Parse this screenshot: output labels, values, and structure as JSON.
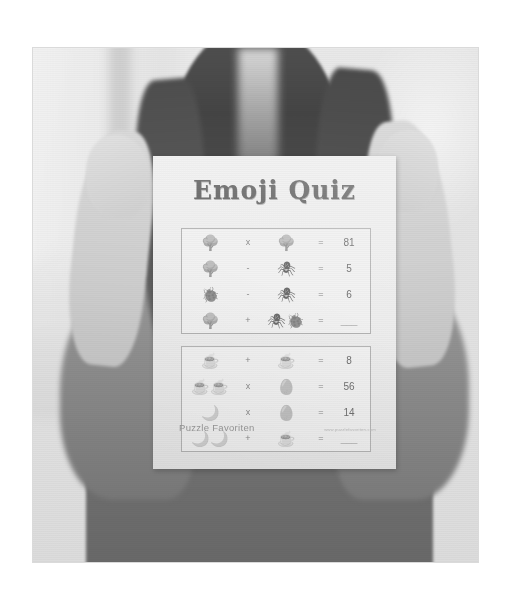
{
  "photo": {
    "subject": "person-holding-worksheet",
    "description": "Grayscale photo of a person holding a printed Emoji Quiz worksheet toward the camera",
    "background": "blurred bright window and room interior"
  },
  "worksheet": {
    "title": "Emoji Quiz",
    "footer": {
      "brand": "Puzzle Favoriten",
      "url": "www.puzzlefavoriten.com"
    },
    "puzzles": [
      {
        "id": "puzzle-1",
        "rows": [
          {
            "left": "🌳",
            "operator": "x",
            "right": "🌳",
            "equals": "=",
            "answer": "81"
          },
          {
            "left": "🌳",
            "operator": "-",
            "right": "🕷",
            "equals": "=",
            "answer": "5"
          },
          {
            "left": "🐞",
            "operator": "-",
            "right": "🕷",
            "equals": "=",
            "answer": "6"
          },
          {
            "left": "🌳",
            "operator": "+",
            "right": "🕷🐞",
            "equals": "=",
            "answer": "___"
          }
        ]
      },
      {
        "id": "puzzle-2",
        "rows": [
          {
            "left": "☕",
            "operator": "+",
            "right": "☕",
            "equals": "=",
            "answer": "8"
          },
          {
            "left": "☕☕",
            "operator": "x",
            "right": "🥚",
            "equals": "=",
            "answer": "56"
          },
          {
            "left": "🌙",
            "operator": "x",
            "right": "🥚",
            "equals": "=",
            "answer": "14"
          },
          {
            "left": "🌙🌙",
            "operator": "+",
            "right": "☕",
            "equals": "=",
            "answer": "___"
          }
        ]
      }
    ]
  },
  "colors": {
    "page_background": "#ffffff",
    "paper": "#fbfbfa",
    "ink": "#5d5d5d",
    "rule": "#b9b9b9",
    "footer_text": "#9a9a9a"
  }
}
